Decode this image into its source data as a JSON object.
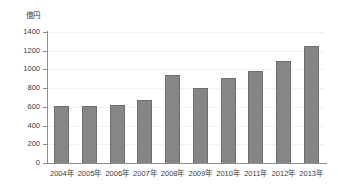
{
  "chart_data": {
    "type": "bar",
    "title": "",
    "subtitle": "",
    "xlabel": "",
    "ylabel": "億円",
    "unit_caption": "億円",
    "categories": [
      "2004年",
      "2005年",
      "2006年",
      "2007年",
      "2008年",
      "2009年",
      "2010年",
      "2011年",
      "2012年",
      "2013年"
    ],
    "values": [
      605,
      605,
      620,
      675,
      945,
      800,
      910,
      980,
      1090,
      1250
    ],
    "ylim": [
      0,
      1400
    ],
    "ytick_values": [
      0,
      200,
      400,
      600,
      800,
      1000,
      1200,
      1400
    ],
    "ytick_labels": [
      "0",
      "200",
      "400",
      "600",
      "800",
      "1000",
      "1200",
      "1400"
    ],
    "grid": true,
    "legend": null,
    "legend_position": "none",
    "series": [
      {
        "name": "億円",
        "values": [
          605,
          605,
          620,
          675,
          945,
          800,
          910,
          980,
          1090,
          1250
        ],
        "color": "#868686"
      }
    ],
    "colors": {
      "bar_fill": "#868686",
      "bar_edge": "#6e6e6e",
      "axis": "#8d8d8d",
      "text": "#3a3a3a",
      "background": "#ffffff"
    }
  }
}
